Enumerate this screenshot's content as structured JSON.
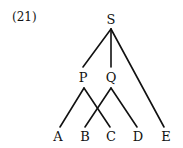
{
  "example_number": "(21)",
  "nodes": {
    "S": {
      "label": "S",
      "x": 111,
      "y": 19
    },
    "P": {
      "label": "P",
      "x": 83,
      "y": 77
    },
    "Q": {
      "label": "Q",
      "x": 111,
      "y": 77
    },
    "A": {
      "label": "A",
      "x": 58,
      "y": 136
    },
    "B": {
      "label": "B",
      "x": 85,
      "y": 136
    },
    "C": {
      "label": "C",
      "x": 111,
      "y": 136
    },
    "D": {
      "label": "D",
      "x": 138,
      "y": 136
    },
    "E": {
      "label": "E",
      "x": 166,
      "y": 136
    }
  },
  "edges": [
    [
      "S",
      "P"
    ],
    [
      "S",
      "Q"
    ],
    [
      "S",
      "E"
    ],
    [
      "P",
      "A"
    ],
    [
      "P",
      "C"
    ],
    [
      "Q",
      "B"
    ],
    [
      "Q",
      "D"
    ]
  ],
  "line_color": "#111111"
}
